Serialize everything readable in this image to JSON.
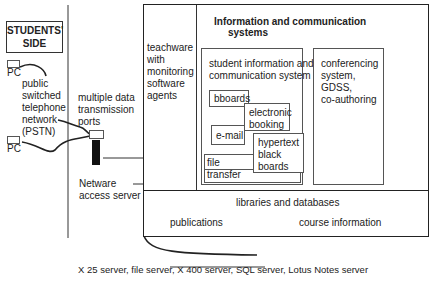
{
  "students_side": {
    "title_line1": "STUDENTS'",
    "title_line2": "SIDE",
    "pc_top": "PC",
    "pc_bottom": "PC",
    "pstn_label": [
      "public",
      "switched",
      "telephone",
      "network",
      "(PSTN)"
    ]
  },
  "transmission": {
    "ports_label": [
      "multiple data",
      "transmission",
      "ports"
    ],
    "server_label": [
      "Netware",
      "access server"
    ]
  },
  "main_system": {
    "teachware_label": [
      "teachware",
      "with",
      "monitoring",
      "software",
      "agents"
    ],
    "ics_title": [
      "Information and communication",
      "systems"
    ],
    "student_ics_title": [
      "student information and",
      "communication system"
    ],
    "modules": {
      "bboards": "bboards",
      "electronic_booking": [
        "electronic",
        "booking"
      ],
      "email": "e-mail",
      "hypertext": [
        "hypertext",
        "black",
        "boards"
      ],
      "file_transfer": "file transfer"
    },
    "conferencing": [
      "conferencing",
      "system,",
      "GDSS,",
      "co-authoring"
    ],
    "libraries": {
      "title": "libraries and databases",
      "publications": "publications",
      "course_information": "course information"
    }
  },
  "servers_caption": "X 25 server, file server, X 400 server, SQL server, Lotus Notes server"
}
